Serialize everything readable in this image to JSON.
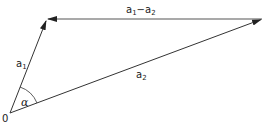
{
  "diagram": {
    "type": "vector-triangle",
    "origin_label": "0",
    "angle_label": "α",
    "vectors": [
      {
        "name": "a1",
        "base": "a",
        "sub": "1",
        "from": [
          10,
          113
        ],
        "to": [
          47,
          19
        ]
      },
      {
        "name": "a2",
        "base": "a",
        "sub": "2",
        "from": [
          10,
          113
        ],
        "to": [
          262,
          19
        ]
      },
      {
        "name": "a1-a2",
        "from": [
          262,
          19
        ],
        "to": [
          47,
          19
        ]
      }
    ],
    "labels": {
      "diff": {
        "a": "a",
        "s1": "1",
        "minus": "−",
        "b": "a",
        "s2": "2"
      },
      "a1": {
        "base": "a",
        "sub": "1"
      },
      "a2": {
        "base": "a",
        "sub": "2"
      }
    },
    "colors": {
      "stroke": "#333333",
      "diff_stroke": "#555555"
    }
  }
}
